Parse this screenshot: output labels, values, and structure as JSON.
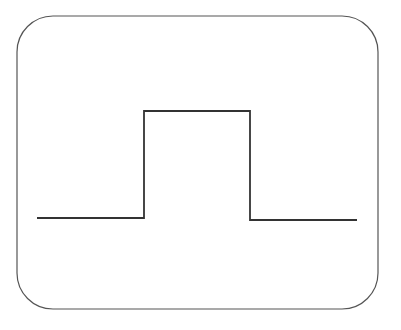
{
  "diagram": {
    "type": "rectangular-pulse",
    "frame": {
      "x": 17,
      "y": 16,
      "width": 361,
      "height": 293,
      "radius": 36,
      "stroke": "#555555",
      "stroke_width": 1.2
    },
    "pulse": {
      "stroke": "#333333",
      "stroke_width": 1.8,
      "points": [
        [
          37,
          218
        ],
        [
          144,
          218
        ],
        [
          144,
          111
        ],
        [
          250,
          111
        ],
        [
          250,
          220
        ],
        [
          357,
          220
        ]
      ]
    }
  }
}
